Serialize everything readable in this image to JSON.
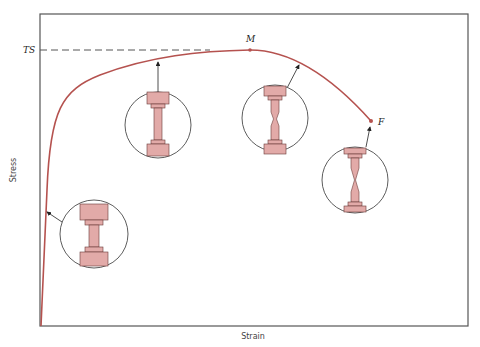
{
  "diagram": {
    "xlabel": "Strain",
    "ylabel": "Stress",
    "labels": {
      "tensile_strength": "TS",
      "max_point": "M",
      "fracture_point": "F"
    },
    "colors": {
      "curve": "#b5524f",
      "specimen_fill": "#e2aaa8",
      "specimen_stroke": "#6a3a38",
      "frame": "#555555",
      "dashed": "#555555"
    },
    "stages": [
      {
        "name": "elastic",
        "description": "Uniform specimen (elastic region)"
      },
      {
        "name": "uniform-plastic",
        "description": "Uniform elongation before M"
      },
      {
        "name": "necking-begins",
        "description": "Neck forming after M"
      },
      {
        "name": "fracture",
        "description": "Fracture at F"
      }
    ]
  }
}
